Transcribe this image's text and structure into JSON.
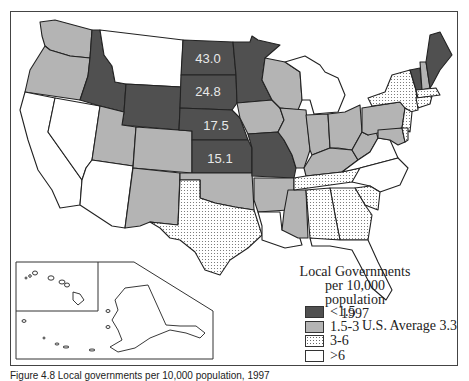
{
  "map": {
    "legend": {
      "title_line1": "Local Governments",
      "title_line2": "per 10,000 population",
      "title_line3": "1997",
      "items": [
        {
          "label": "<1.5",
          "pattern": "dark",
          "color": "#505050"
        },
        {
          "label": "1.5-3",
          "pattern": "light",
          "color": "#b4b4b4"
        },
        {
          "label": "3-6",
          "pattern": "dotted",
          "color": "#ffffff"
        },
        {
          "label": ">6",
          "pattern": "white",
          "color": "#ffffff"
        }
      ],
      "us_average": "U.S. Average 3.3"
    },
    "state_labels": [
      {
        "state": "North Dakota",
        "value": "43.0"
      },
      {
        "state": "South Dakota",
        "value": "24.8"
      },
      {
        "state": "Nebraska",
        "value": "17.5"
      },
      {
        "state": "Kansas",
        "value": "15.1"
      }
    ],
    "state_shading": {
      "dark": [
        "ID",
        "WY",
        "ND",
        "SD",
        "NE",
        "KS",
        "MN",
        "MO",
        "ME",
        "VT"
      ],
      "light": [
        "WA",
        "OR",
        "UT",
        "CO",
        "NM",
        "OK",
        "IA",
        "WI",
        "IL",
        "IN",
        "OH",
        "PA",
        "WV",
        "KY",
        "AR",
        "MS",
        "MD",
        "NH"
      ],
      "dotted": [
        "TX",
        "TN",
        "AL",
        "GA",
        "SC",
        "NY",
        "NJ",
        "DE",
        "MA",
        "CT",
        "RI"
      ],
      "white": [
        "CA",
        "NV",
        "AZ",
        "MT",
        "MI",
        "LA",
        "FL",
        "NC",
        "VA",
        "AK",
        "HI"
      ]
    },
    "inset": "Alaska and Hawaii"
  },
  "caption": "Figure 4.8   Local governments per 10,000 population, 1997"
}
